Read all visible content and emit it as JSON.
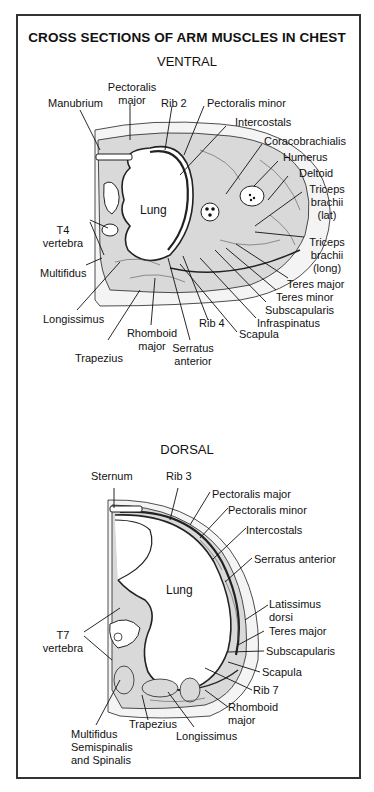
{
  "figure": {
    "title": "CROSS SECTIONS OF ARM MUSCLES IN CHEST",
    "colors": {
      "frame": "#333333",
      "ink": "#111111",
      "muscle_fill": "#d9d9d9",
      "background": "#ffffff"
    }
  },
  "ventral": {
    "heading": "VENTRAL",
    "organ_label": "Lung",
    "labels": {
      "manubrium": "Manubrium",
      "pectoralis_major_1": "Pectoralis",
      "pectoralis_major_2": "major",
      "rib2": "Rib 2",
      "pectoralis_minor": "Pectoralis minor",
      "intercostals": "Intercostals",
      "coracobrachialis": "Coracobrachialis",
      "humerus": "Humerus",
      "deltoid": "Deltoid",
      "triceps_lat_1": "Triceps",
      "triceps_lat_2": "brachii",
      "triceps_lat_3": "(lat)",
      "triceps_long_1": "Triceps",
      "triceps_long_2": "brachii",
      "triceps_long_3": "(long)",
      "t4_1": "T4",
      "t4_2": "vertebra",
      "multifidus": "Multifidus",
      "longissimus": "Longissimus",
      "trapezius": "Trapezius",
      "rhomboid_1": "Rhomboid",
      "rhomboid_2": "major",
      "serratus_1": "Serratus",
      "serratus_2": "anterior",
      "rib4": "Rib 4",
      "scapula": "Scapula",
      "infraspinatus": "Infraspinatus",
      "subscapularis": "Subscapularis",
      "teres_minor": "Teres minor",
      "teres_major": "Teres major"
    }
  },
  "dorsal": {
    "heading": "DORSAL",
    "organ_label": "Lung",
    "labels": {
      "sternum": "Sternum",
      "rib3": "Rib 3",
      "pectoralis_major": "Pectoralis major",
      "pectoralis_minor": "Pectoralis minor",
      "intercostals": "Intercostals",
      "serratus_anterior": "Serratus anterior",
      "latissimus_1": "Latissimus",
      "latissimus_2": "dorsi",
      "teres_major": "Teres major",
      "subscapularis": "Subscapularis",
      "scapula": "Scapula",
      "rib7": "Rib 7",
      "rhomboid_1": "Rhomboid",
      "rhomboid_2": "major",
      "t7_1": "T7",
      "t7_2": "vertebra",
      "trapezius": "Trapezius",
      "longissimus": "Longissimus",
      "multifidus_1": "Multifidus",
      "multifidus_2": "Semispinalis",
      "multifidus_3": "and Spinalis"
    }
  }
}
